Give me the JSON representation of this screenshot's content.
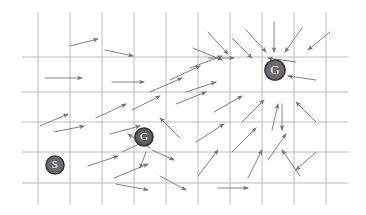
{
  "figure": {
    "kind": "grid-world-policy-vector-field",
    "background_color": "#ffffff",
    "width": 366,
    "height": 215
  },
  "grid": {
    "line_color": "#b4b4b4",
    "line_width": 0.9,
    "x_lines": [
      38,
      70,
      102,
      134,
      166,
      198,
      230,
      262,
      294,
      326
    ],
    "y_lines": [
      57,
      92,
      122,
      152,
      183
    ],
    "x_extent": [
      22,
      348
    ],
    "y_extent": [
      12,
      205
    ]
  },
  "arrows": {
    "color": "#70707a",
    "head_color": "#70707a",
    "line_width": 0.9,
    "items": [
      {
        "x1": 70,
        "y1": 46,
        "x2": 98,
        "y2": 39
      },
      {
        "x1": 105,
        "y1": 50,
        "x2": 133,
        "y2": 56
      },
      {
        "x1": 193,
        "y1": 48,
        "x2": 222,
        "y2": 60
      },
      {
        "x1": 246,
        "y1": 30,
        "x2": 266,
        "y2": 52
      },
      {
        "x1": 274,
        "y1": 22,
        "x2": 274,
        "y2": 52
      },
      {
        "x1": 302,
        "y1": 28,
        "x2": 285,
        "y2": 52
      },
      {
        "x1": 330,
        "y1": 32,
        "x2": 308,
        "y2": 50
      },
      {
        "x1": 208,
        "y1": 32,
        "x2": 228,
        "y2": 54
      },
      {
        "x1": 45,
        "y1": 78,
        "x2": 82,
        "y2": 78
      },
      {
        "x1": 112,
        "y1": 82,
        "x2": 144,
        "y2": 82
      },
      {
        "x1": 190,
        "y1": 68,
        "x2": 222,
        "y2": 56
      },
      {
        "x1": 208,
        "y1": 58,
        "x2": 234,
        "y2": 58
      },
      {
        "x1": 232,
        "y1": 38,
        "x2": 252,
        "y2": 58
      },
      {
        "x1": 296,
        "y1": 62,
        "x2": 268,
        "y2": 58
      },
      {
        "x1": 316,
        "y1": 80,
        "x2": 288,
        "y2": 76
      },
      {
        "x1": 170,
        "y1": 80,
        "x2": 200,
        "y2": 66
      },
      {
        "x1": 150,
        "y1": 92,
        "x2": 182,
        "y2": 78
      },
      {
        "x1": 186,
        "y1": 92,
        "x2": 216,
        "y2": 82
      },
      {
        "x1": 40,
        "y1": 126,
        "x2": 68,
        "y2": 114
      },
      {
        "x1": 96,
        "y1": 118,
        "x2": 126,
        "y2": 104
      },
      {
        "x1": 132,
        "y1": 110,
        "x2": 160,
        "y2": 96
      },
      {
        "x1": 176,
        "y1": 104,
        "x2": 206,
        "y2": 92
      },
      {
        "x1": 214,
        "y1": 112,
        "x2": 242,
        "y2": 96
      },
      {
        "x1": 242,
        "y1": 122,
        "x2": 264,
        "y2": 100
      },
      {
        "x1": 272,
        "y1": 130,
        "x2": 278,
        "y2": 104
      },
      {
        "x1": 316,
        "y1": 122,
        "x2": 296,
        "y2": 102
      },
      {
        "x1": 54,
        "y1": 132,
        "x2": 84,
        "y2": 126
      },
      {
        "x1": 110,
        "y1": 134,
        "x2": 140,
        "y2": 126
      },
      {
        "x1": 180,
        "y1": 138,
        "x2": 160,
        "y2": 118
      },
      {
        "x1": 122,
        "y1": 152,
        "x2": 152,
        "y2": 138
      },
      {
        "x1": 196,
        "y1": 142,
        "x2": 224,
        "y2": 124
      },
      {
        "x1": 232,
        "y1": 152,
        "x2": 256,
        "y2": 128
      },
      {
        "x1": 268,
        "y1": 160,
        "x2": 286,
        "y2": 134
      },
      {
        "x1": 150,
        "y1": 148,
        "x2": 128,
        "y2": 134
      },
      {
        "x1": 152,
        "y1": 150,
        "x2": 174,
        "y2": 160
      },
      {
        "x1": 146,
        "y1": 152,
        "x2": 140,
        "y2": 168
      },
      {
        "x1": 88,
        "y1": 166,
        "x2": 118,
        "y2": 156
      },
      {
        "x1": 114,
        "y1": 178,
        "x2": 148,
        "y2": 164
      },
      {
        "x1": 198,
        "y1": 176,
        "x2": 218,
        "y2": 150
      },
      {
        "x1": 248,
        "y1": 178,
        "x2": 262,
        "y2": 150
      },
      {
        "x1": 300,
        "y1": 176,
        "x2": 282,
        "y2": 150
      },
      {
        "x1": 282,
        "y1": 104,
        "x2": 282,
        "y2": 130
      },
      {
        "x1": 116,
        "y1": 184,
        "x2": 148,
        "y2": 190
      },
      {
        "x1": 160,
        "y1": 176,
        "x2": 186,
        "y2": 190
      },
      {
        "x1": 218,
        "y1": 188,
        "x2": 248,
        "y2": 188
      },
      {
        "x1": 316,
        "y1": 152,
        "x2": 296,
        "y2": 170
      }
    ]
  },
  "nodes": [
    {
      "label": "S",
      "name": "start-node",
      "x": 55,
      "y": 165,
      "r": 9,
      "fill": "#6b6b6b",
      "text_color": "#ffffff",
      "ring": "#3a3a3a"
    },
    {
      "label": "G",
      "name": "goal-node-mid",
      "x": 144,
      "y": 137,
      "r": 9,
      "fill": "#5f5f5f",
      "text_color": "#ffffff",
      "ring": "#2f2f2f"
    },
    {
      "label": "G",
      "name": "goal-node-main",
      "x": 275,
      "y": 70,
      "r": 10,
      "fill": "#6b6b6b",
      "text_color": "#ffffff",
      "ring": "#3a3a3a"
    }
  ]
}
